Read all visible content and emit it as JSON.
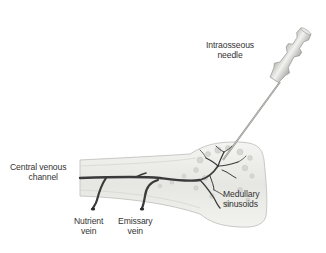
{
  "figure": {
    "type": "anatomical-diagram",
    "labels": {
      "needle": [
        "Intraosseous",
        "needle"
      ],
      "central_channel": [
        "Central venous",
        "channel"
      ],
      "sinusoids": [
        "Medullary",
        "sinusoids"
      ],
      "nutrient_vein": [
        "Nutrient",
        "vein"
      ],
      "emissary_vein": [
        "Emissary",
        "vein"
      ]
    },
    "colors": {
      "background": "#ffffff",
      "bone_fill": "#ebebe8",
      "bone_outline": "#c8c8c4",
      "marrow": "#d8d8d4",
      "vessel": "#3a3a3a",
      "needle": "#d4d4d2",
      "label_text": "#333333"
    }
  }
}
